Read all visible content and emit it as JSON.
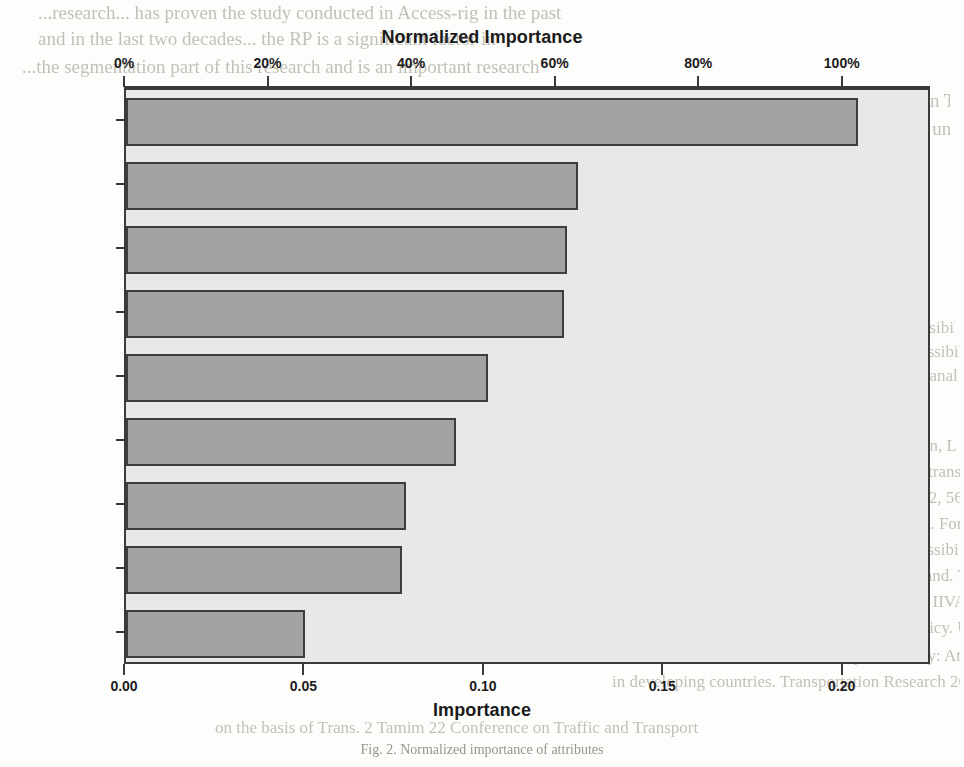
{
  "chart_data": {
    "type": "bar",
    "orientation": "horizontal",
    "title": "Normalized Importance",
    "xlabel": "Importance",
    "ylabel": "",
    "secondary_axis_label": "Normalized Importance",
    "categories": [
      "Access",
      "Vehicle",
      "T.Des",
      "T.IVTT",
      "T.Wait",
      "Income",
      "Age",
      "Occupation",
      "Gender"
    ],
    "values": [
      0.204,
      0.126,
      0.123,
      0.122,
      0.101,
      0.092,
      0.078,
      0.077,
      0.05
    ],
    "normalized_values": [
      100.0,
      61.8,
      60.3,
      59.8,
      49.5,
      45.1,
      38.2,
      37.7,
      24.5
    ],
    "xlim": [
      0.0,
      0.2246
    ],
    "normalized_xlim": [
      0,
      112.3
    ],
    "grid": false,
    "legend": null,
    "bottom_axis": {
      "label": "Importance",
      "ticks": [
        0.0,
        0.05,
        0.1,
        0.15,
        0.2
      ],
      "tick_labels": [
        "0.00",
        "0.05",
        "0.10",
        "0.15",
        "0.20"
      ]
    },
    "top_axis": {
      "label": "Normalized Importance",
      "ticks": [
        0,
        20,
        40,
        60,
        80,
        100
      ],
      "tick_labels": [
        "0%",
        "20%",
        "40%",
        "60%",
        "80%",
        "100%"
      ]
    },
    "colors": {
      "bar_fill": "#a2a2a2",
      "bar_stroke": "#3d3d3d",
      "plot_background": "#e8e8e6",
      "frame": "#3a3a3a",
      "text": "#1b1b1b",
      "page_background": "#fdfdfb"
    }
  },
  "caption": "Fig. 2. Normalized importance of attributes",
  "background_text": {
    "lines": [
      {
        "text": "...research...  has   proven  the study  conducted  in  Access-rig in the past",
        "x": 38,
        "y": 2,
        "size": 19,
        "width": 880
      },
      {
        "text": "and in   the  last   two  decades... the  RP is  a  significant factor  in",
        "x": 38,
        "y": 28,
        "size": 19,
        "width": 830
      },
      {
        "text": "...the  segmentation  part  of this  research   and is  an  important research",
        "x": 22,
        "y": 56,
        "size": 19,
        "width": 850
      },
      {
        "text": "in  EFA   and   they   are   tabulated  as  shown  in  Table  5.  It  is  B-M",
        "x": 620,
        "y": 90,
        "size": 19,
        "width": 330
      },
      {
        "text": "...attribute  and  the  value  of  the  attributes  under  consideration",
        "x": 620,
        "y": 118,
        "size": 19,
        "width": 330
      },
      {
        "text": "significant",
        "x": 620,
        "y": 146,
        "size": 19,
        "width": 330
      },
      {
        "text": "tive  levels  of  the  vari...",
        "x": 620,
        "y": 174,
        "size": 19,
        "width": 330
      },
      {
        "text": "References",
        "x": 620,
        "y": 246,
        "size": 21,
        "width": 300
      },
      {
        "text": "Cantu  J.  Lopez  P.  A.  R.  A.  Morikawa  T.  Accessibility  a",
        "x": 615,
        "y": 318,
        "size": 17,
        "width": 340
      },
      {
        "text": "mies  G.,  Hardy,  S.,  Kerschner,  K.,  2008.  Accessibility  and  sustainability",
        "x": 615,
        "y": 342,
        "size": 17,
        "width": 345
      },
      {
        "text": "augments  Transportation   modelling   and   data   analysis  4  (1),  9-",
        "x": 622,
        "y": 366,
        "size": 17,
        "width": 335
      },
      {
        "text": "20,  pp-pp.,  2010.",
        "x": 622,
        "y": 390,
        "size": 17,
        "width": 330
      },
      {
        "text": "Hogstadt   and   Levi  Er.,  J.  R.,  Ley,  T.,  Samperkin,  L.,  2009.  Methods of",
        "x": 612,
        "y": 436,
        "size": 17,
        "width": 345
      },
      {
        "text": "segmentation  used  in  the  placement  of   Travel  transportation  analysis",
        "x": 615,
        "y": 462,
        "size": 17,
        "width": 345
      },
      {
        "text": "Methods   and   transport  theory,  12  (4),  Policy  12,  56.",
        "x": 615,
        "y": 488,
        "size": 17,
        "width": 345
      },
      {
        "text": "Chen,   S.  E.,  Attitudinal  Measures:  A  treatment.  Forum  D.  Ass.   1985.",
        "x": 615,
        "y": 514,
        "size": 17,
        "width": 345
      },
      {
        "text": "Stopher,   P.  O.,  Vanier,  R.  and  Measuring  accessibility  travel   P.A.",
        "x": 618,
        "y": 540,
        "size": 17,
        "width": 340
      },
      {
        "text": "analysis  for  planning  attitudes  and  travel  demand.  Trans.  Res.   Board.",
        "x": 615,
        "y": 566,
        "size": 17,
        "width": 345
      },
      {
        "text": "Harkness,  M.  D.  D.,  Archibald,  R.  Samples,  A.  IIVAL  to  be  the  E  and   A.  Univ.  of",
        "x": 610,
        "y": 592,
        "size": 17,
        "width": 350
      },
      {
        "text": "IIVAL  for  evaluating  methods  of  consumer   policy.  U.  Tr.  Comm.  Centre,",
        "x": 610,
        "y": 618,
        "size": 17,
        "width": 350
      },
      {
        "text": "Frank,  Alan.  P.  E.  S.  K.  Accessibility  -  Mobility:  Attitudes  and  non-work  Modes",
        "x": 612,
        "y": 646,
        "size": 17,
        "width": 348
      },
      {
        "text": "in  developing  countries.  Transportation  Research  26  (6),  pp.  433-457.",
        "x": 612,
        "y": 672,
        "size": 17,
        "width": 348
      },
      {
        "text": "on  the  basis  of  Trans.  2  Tamim  22  Conference  on  Traffic  and  Transport",
        "x": 215,
        "y": 718,
        "size": 17,
        "width": 560
      }
    ]
  }
}
